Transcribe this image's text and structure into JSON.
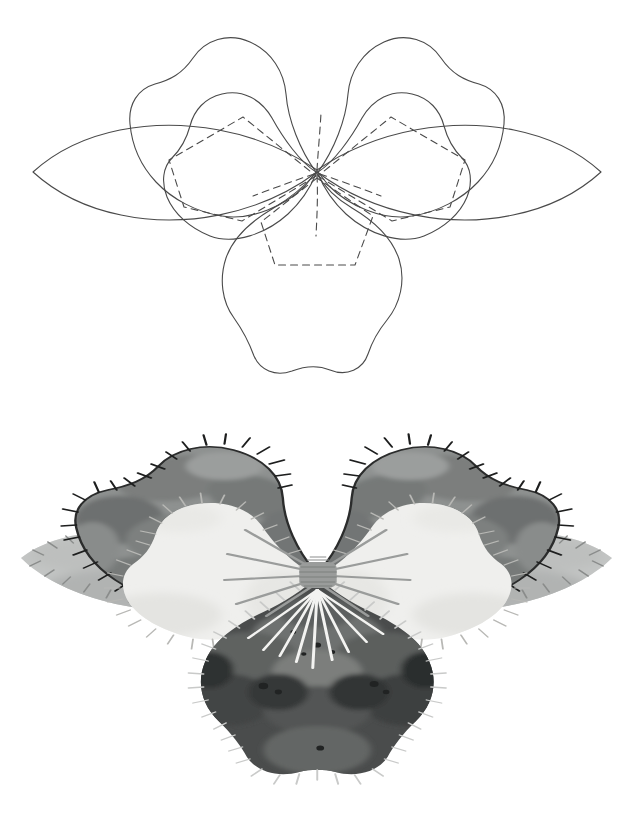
{
  "page": {
    "background_color": "#ffffff",
    "width": 633,
    "height": 823,
    "figure_count": 2
  },
  "figures": [
    {
      "id": "line-pattern-diagram",
      "name": "pansy-assembly-line-drawing",
      "style": "outline line art, no fill",
      "stroke_color": "#4a4a4a",
      "solid_stroke_width": 1.1,
      "dashed_stroke_width": 1.1,
      "dash_pattern": "7 5",
      "description": "Five-petal pansy layout shown as contour outlines; solid lines are visible petal edges, dashed lines are hidden seam/underlap edges converging on a central point.",
      "center_point": {
        "x": 316,
        "y": 170
      },
      "parts": [
        {
          "name": "left-sepal-leaf",
          "shape": "pointed lens",
          "line": "solid"
        },
        {
          "name": "right-sepal-leaf",
          "shape": "pointed lens",
          "line": "solid"
        },
        {
          "name": "upper-left-petal",
          "shape": "wavy scalloped lobe",
          "line": "solid"
        },
        {
          "name": "upper-right-petal",
          "shape": "wavy scalloped lobe",
          "line": "solid"
        },
        {
          "name": "inner-left-petal",
          "shape": "rounded lobe",
          "line": "solid"
        },
        {
          "name": "inner-right-petal",
          "shape": "rounded lobe",
          "line": "solid"
        },
        {
          "name": "bottom-lip-petal",
          "shape": "broad rounded lobe with notched base",
          "line": "solid"
        },
        {
          "name": "hidden-underlap-left",
          "shape": "pentagon",
          "line": "dashed"
        },
        {
          "name": "hidden-underlap-right",
          "shape": "pentagon",
          "line": "dashed"
        },
        {
          "name": "hidden-underlap-bottom",
          "shape": "pentagon",
          "line": "dashed"
        }
      ]
    },
    {
      "id": "finished-felt-illustration",
      "name": "pansy-finished-rendering",
      "style": "grayscale mottled watercolour/felt shading with blanket-stitch edging",
      "palette": {
        "paper": "#ffffff",
        "leaf_light": "#c3c5c4",
        "leaf_light_shade": "#b0b2b1",
        "petal_mid": "#8e9190",
        "petal_mid_shade": "#7a7d7c",
        "petal_mid_dark": "#6a6d6c",
        "petal_white": "#efefed",
        "petal_white_shade": "#e2e2df",
        "petal_dark": "#5b5d5c",
        "petal_dark_deep": "#3f4141",
        "petal_dark_blotch": "#2e3030",
        "outline_dark": "#2b2c2c",
        "stitch_dark": "#1d1e1e",
        "stitch_light": "#f2f2f0",
        "stitch_mid": "#8a8c8b",
        "center_knot": "#9a9c9b"
      },
      "parts": [
        {
          "name": "left-sepal-leaf",
          "fill": "#c3c5c4",
          "stitch": "#8a8c8b",
          "stitch_count": 26
        },
        {
          "name": "right-sepal-leaf",
          "fill": "#c3c5c4",
          "stitch": "#8a8c8b",
          "stitch_count": 26
        },
        {
          "name": "upper-left-petal",
          "fill": "#8e9190",
          "stitch": "#1d1e1e",
          "stitch_count": 24
        },
        {
          "name": "upper-right-petal",
          "fill": "#8e9190",
          "stitch": "#1d1e1e",
          "stitch_count": 24
        },
        {
          "name": "inner-left-petal",
          "fill": "#efefed",
          "stitch": "#b8b8b5",
          "stitch_count": 28
        },
        {
          "name": "inner-right-petal",
          "fill": "#efefed",
          "stitch": "#b8b8b5",
          "stitch_count": 28
        },
        {
          "name": "bottom-lip-petal",
          "fill": "#4a4c4c",
          "stitch": "#c8c9c8",
          "stitch_count": 34
        },
        {
          "name": "center-knot",
          "fill": "#9a9c9b",
          "shape": "wrapped bullion knot"
        },
        {
          "name": "center-rays-upper",
          "count": 9,
          "color": "#9a9c9b"
        },
        {
          "name": "center-rays-lower",
          "count": 9,
          "color": "#f2f2f0"
        }
      ]
    }
  ]
}
